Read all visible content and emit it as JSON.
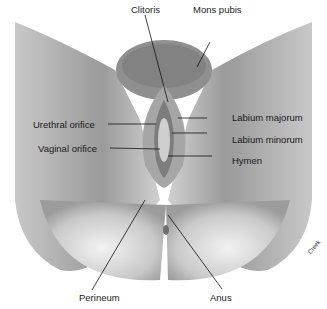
{
  "figure": {
    "background": "#ffffff",
    "tone_dark": "#8a8a8a",
    "tone_mid": "#b5b5b5",
    "tone_light": "#d9d9d9"
  },
  "labels": {
    "clitoris": "Clitoris",
    "mons_pubis": "Mons pubis",
    "labium_majorum": "Labium majorum",
    "labium_minorum": "Labium minorum",
    "hymen": "Hymen",
    "urethral_orifice": "Urethral orifice",
    "vaginal_orifice": "Vaginal orifice",
    "perineum": "Perineum",
    "anus": "Anus"
  },
  "credit": "Creek"
}
